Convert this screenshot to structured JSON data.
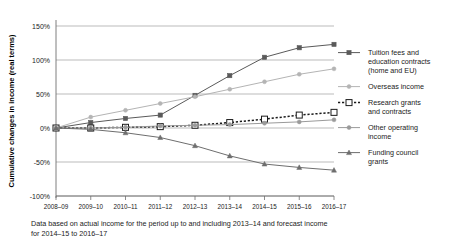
{
  "chart_data": {
    "type": "line",
    "title": "",
    "xlabel": "",
    "ylabel": "Cumulative changes in income (real terms)",
    "categories": [
      "2008–09",
      "2009–10",
      "2010–11",
      "2011–12",
      "2012–13",
      "2013–14",
      "2014–15",
      "2015–16",
      "2016–17"
    ],
    "ylim": [
      -100,
      150
    ],
    "yticks": [
      "150%",
      "100%",
      "50%",
      "0%",
      "-50%",
      "-100%"
    ],
    "ytick_values": [
      150,
      100,
      50,
      0,
      -50,
      -100
    ],
    "grid": true,
    "legend_position": "right",
    "series": [
      {
        "name": "Tuition fees and education contracts (home and EU)",
        "values": [
          0,
          8,
          14,
          19,
          48,
          77,
          104,
          118,
          123
        ],
        "color": "#5a5a5a",
        "marker": "square",
        "dash": "none"
      },
      {
        "name": "Overseas income",
        "values": [
          0,
          16,
          26,
          36,
          46,
          57,
          68,
          79,
          87
        ],
        "color": "#b4b4b4",
        "marker": "circle",
        "dash": "none"
      },
      {
        "name": "Research grants and contracts",
        "values": [
          0,
          0,
          1,
          2,
          4,
          8,
          13,
          19,
          23
        ],
        "color": "#1a1a1a",
        "marker": "open-square",
        "dash": "dotted"
      },
      {
        "name": "Other operating income",
        "values": [
          0,
          0,
          1,
          3,
          4,
          5,
          7,
          9,
          12
        ],
        "color": "#9a9a9a",
        "marker": "circle",
        "dash": "none"
      },
      {
        "name": "Funding council grants",
        "values": [
          0,
          -2,
          -7,
          -14,
          -26,
          -41,
          -53,
          -58,
          -62
        ],
        "color": "#6e6e6e",
        "marker": "triangle",
        "dash": "none"
      }
    ],
    "legend": [
      "Tuition fees and education contracts (home and EU)",
      "Overseas income",
      "Research grants and contracts",
      "Other operating income",
      "Funding council grants"
    ],
    "legend_lines": [
      [
        "Tuition fees and",
        "education contracts",
        "(home and EU)"
      ],
      [
        "Overseas income"
      ],
      [
        "Research grants",
        "and contracts"
      ],
      [
        "Other operating",
        "income"
      ],
      [
        "Funding council",
        "grants"
      ]
    ],
    "footnote": "Data based on actual income for the period up to and including 2013–14 and forecast income for 2014–15 to 2016–17",
    "footnote_lines": [
      "Data based on actual income for the period up to and including 2013–14 and forecast income",
      "for 2014–15 to 2016–17"
    ],
    "colors": {
      "grid": "#9f9f9f",
      "axis": "#6f6f6f",
      "text": "#222222"
    }
  }
}
